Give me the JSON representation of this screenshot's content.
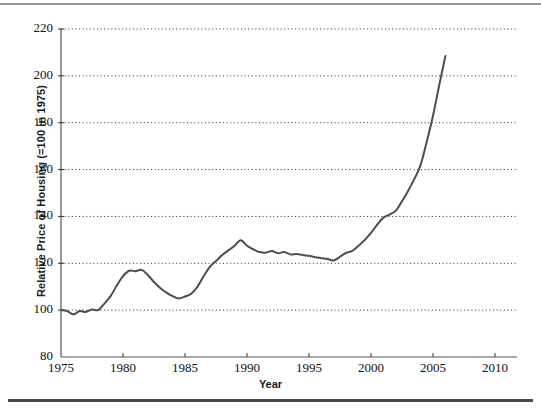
{
  "figure": {
    "top_rule_color": "#9a9a9a",
    "bottom_rule_color": "#4a4a4a",
    "background": "#ffffff"
  },
  "chart_data": {
    "type": "line",
    "title": "",
    "xlabel": "Year",
    "ylabel": "Relative Price of Housing (=100 in 1975)",
    "xlim": [
      1975,
      2010
    ],
    "ylim": [
      80,
      220
    ],
    "xticks": [
      1975,
      1980,
      1985,
      1990,
      1995,
      2000,
      2005,
      2010
    ],
    "xtick_labels": [
      "1975",
      "1980",
      "1985",
      "1990",
      "1995",
      "2000",
      "2005",
      "2010"
    ],
    "yticks": [
      80,
      100,
      120,
      140,
      160,
      180,
      200,
      220
    ],
    "ytick_labels": [
      "80",
      "100",
      "120",
      "140",
      "160",
      "180",
      "200",
      "220"
    ],
    "grid": "horizontal dotted gridlines at each y tick from 100 to 220",
    "legend": "none",
    "line_color": "#4d4d4d",
    "line_width": 2.0,
    "series": [
      {
        "name": "Relative Price of Housing",
        "x": [
          1975.0,
          1975.5,
          1976.0,
          1976.5,
          1977.0,
          1977.5,
          1978.0,
          1978.5,
          1979.0,
          1979.5,
          1980.0,
          1980.5,
          1981.0,
          1981.5,
          1982.0,
          1982.5,
          1983.0,
          1983.5,
          1984.0,
          1984.5,
          1985.0,
          1985.5,
          1986.0,
          1986.5,
          1987.0,
          1987.5,
          1988.0,
          1988.5,
          1989.0,
          1989.5,
          1990.0,
          1990.5,
          1991.0,
          1991.5,
          1992.0,
          1992.5,
          1993.0,
          1993.5,
          1994.0,
          1994.5,
          1995.0,
          1995.5,
          1996.0,
          1996.5,
          1997.0,
          1997.5,
          1998.0,
          1998.5,
          1999.0,
          1999.5,
          2000.0,
          2000.5,
          2001.0,
          2001.5,
          2002.0,
          2002.5,
          2003.0,
          2003.5,
          2004.0,
          2004.5,
          2005.0,
          2005.5,
          2006.0
        ],
        "values": [
          100.0,
          99.6,
          98.2,
          99.6,
          99.2,
          100.3,
          100.0,
          102.8,
          106.0,
          110.5,
          114.5,
          116.8,
          116.6,
          117.2,
          115.0,
          112.0,
          109.5,
          107.5,
          106.0,
          105.0,
          105.8,
          107.0,
          110.0,
          114.5,
          118.5,
          121.0,
          123.5,
          125.5,
          127.5,
          129.8,
          127.5,
          126.0,
          124.8,
          124.5,
          125.2,
          124.3,
          124.8,
          123.8,
          124.0,
          123.5,
          123.2,
          122.6,
          122.2,
          121.8,
          121.2,
          122.8,
          124.5,
          125.3,
          127.5,
          130.0,
          133.0,
          136.5,
          139.5,
          140.8,
          142.5,
          146.5,
          151.0,
          156.0,
          162.0,
          172.0,
          183.0,
          196.0,
          208.5
        ]
      }
    ]
  }
}
